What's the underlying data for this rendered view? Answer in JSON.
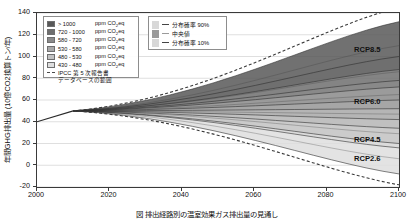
{
  "chart_data": {
    "type": "area",
    "title": "",
    "xlabel": "",
    "ylabel": "年間GHG排出量 (10億CO2換算トン/年)",
    "xlim": [
      2000,
      2100
    ],
    "ylim": [
      -20,
      140
    ],
    "xticks": [
      "2000",
      "2020",
      "2040",
      "2060",
      "2080",
      "2100"
    ],
    "yticks": [
      "140",
      "120",
      "100",
      "80",
      "60",
      "40",
      "20",
      "0",
      "-20"
    ],
    "grid": true,
    "legend_position": "top-left",
    "baseline_year": 2010,
    "baseline_value": 50,
    "bands": [
      {
        "label": "> 1000",
        "unit": "ppm CO2eq",
        "color": "#585858",
        "end_low": 88,
        "end_high": 132
      },
      {
        "label": "720 - 1000",
        "unit": "ppm CO2eq",
        "color": "#6e6e6e",
        "end_low": 72,
        "end_high": 100
      },
      {
        "label": "580 - 720",
        "unit": "ppm CO2eq",
        "color": "#8a8a8a",
        "end_low": 52,
        "end_high": 78
      },
      {
        "label": "530 - 580",
        "unit": "ppm CO2eq",
        "color": "#a8a8a8",
        "end_low": 34,
        "end_high": 60
      },
      {
        "label": "480 - 530",
        "unit": "ppm CO2eq",
        "color": "#c2c2c2",
        "end_low": 16,
        "end_high": 42
      },
      {
        "label": "430 - 480",
        "unit": "ppm CO2eq",
        "color": "#dedede",
        "end_low": -8,
        "end_high": 20
      }
    ],
    "ipcc_range": {
      "label_line1": "IPCC 第 5 次報告書",
      "label_line2": "データベースの範囲",
      "upper_end": 145,
      "lower_end": -18
    },
    "probability": [
      {
        "label": "分布確率 90%",
        "marker": "line",
        "color": "#444444"
      },
      {
        "label": "中央値",
        "marker": "swatch",
        "color": "#9a9a9a"
      },
      {
        "label": "分布確率 10%",
        "marker": "line",
        "color": "#444444"
      }
    ],
    "scenario_labels": [
      {
        "name": "RCP8.5",
        "value_2100": 105
      },
      {
        "name": "RCP6.0",
        "value_2100": 57
      },
      {
        "name": "RCP4.5",
        "value_2100": 22
      },
      {
        "name": "RCP2.6",
        "value_2100": 5
      }
    ]
  },
  "caption": "図    排出経路別の温室効果ガス排出量の見通し"
}
